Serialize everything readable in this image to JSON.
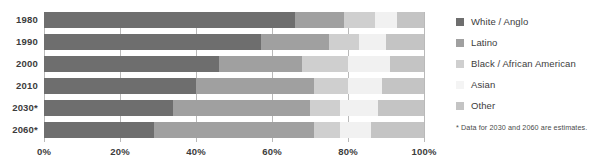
{
  "chart_data": {
    "type": "bar",
    "orientation": "horizontal",
    "stacked": true,
    "normalized_percent": true,
    "title": "",
    "xlabel": "",
    "ylabel": "",
    "xlim": [
      0,
      100
    ],
    "grid": true,
    "legend_position": "right",
    "categories": [
      "1980",
      "1990",
      "2000",
      "2010",
      "2030*",
      "2060*"
    ],
    "x_tick_labels": [
      "0%",
      "20%",
      "40%",
      "60%",
      "80%",
      "100%"
    ],
    "x_tick_values": [
      0,
      20,
      40,
      60,
      80,
      100
    ],
    "series": [
      {
        "name": "White / Anglo",
        "color": "#6e6e6e",
        "values": [
          66,
          57,
          46,
          40,
          34,
          29
        ]
      },
      {
        "name": "Latino",
        "color": "#a0a0a0",
        "values": [
          13,
          18,
          22,
          31,
          36,
          42
        ]
      },
      {
        "name": "Black / African American",
        "color": "#cfcfcf",
        "values": [
          8,
          8,
          12,
          9,
          8,
          7
        ]
      },
      {
        "name": "Asian",
        "color": "#f1f1f1",
        "values": [
          6,
          7,
          11,
          9,
          10,
          8
        ]
      },
      {
        "name": "Other",
        "color": "#c4c4c4",
        "values": [
          7,
          10,
          9,
          11,
          12,
          14
        ]
      }
    ],
    "annotations": [
      "* Data for 2030 and 2060 are estimates."
    ]
  },
  "legend": {
    "items": [
      {
        "label": "White / Anglo",
        "color": "#6e6e6e"
      },
      {
        "label": "Latino",
        "color": "#a0a0a0"
      },
      {
        "label": "Black / African American",
        "color": "#cfcfcf"
      },
      {
        "label": "Asian",
        "color": "#f4f4f4"
      },
      {
        "label": "Other",
        "color": "#c4c4c4"
      }
    ],
    "note": "* Data for 2030 and 2060 are estimates."
  },
  "colors": {
    "gridline": "#b9b9b9",
    "text": "#3c3c3c",
    "background": "#ffffff"
  }
}
